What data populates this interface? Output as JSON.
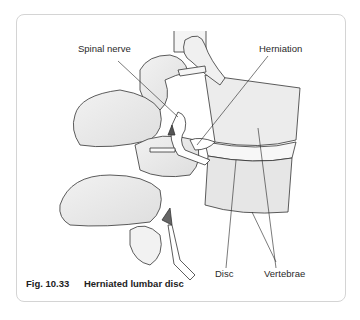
{
  "figure": {
    "caption_number": "Fig. 10.33",
    "caption_title": "Herniated lumbar disc",
    "labels": {
      "spinal_nerve": "Spinal nerve",
      "herniation": "Herniation",
      "disc": "Disc",
      "vertebrae": "Vertebrae"
    }
  }
}
